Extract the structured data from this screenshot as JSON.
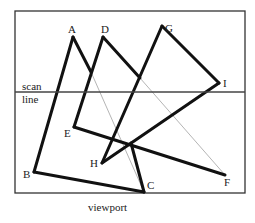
{
  "figure": {
    "caption": "viewport",
    "scan_line_label_1": "scan",
    "scan_line_label_2": "line",
    "colors": {
      "edge": "#111111",
      "hidden_edge": "#b0b0b0",
      "frame": "#333333",
      "background": "#ffffff"
    },
    "triangles": [
      {
        "name": "ABC",
        "vertices": [
          "A",
          "B",
          "C"
        ]
      },
      {
        "name": "DEF",
        "vertices": [
          "D",
          "E",
          "F"
        ]
      },
      {
        "name": "GHI",
        "vertices": [
          "G",
          "H",
          "I"
        ]
      }
    ],
    "vertex_labels": {
      "A": "A",
      "B": "B",
      "C": "C",
      "D": "D",
      "E": "E",
      "F": "F",
      "G": "G",
      "H": "H",
      "I": "I"
    }
  }
}
